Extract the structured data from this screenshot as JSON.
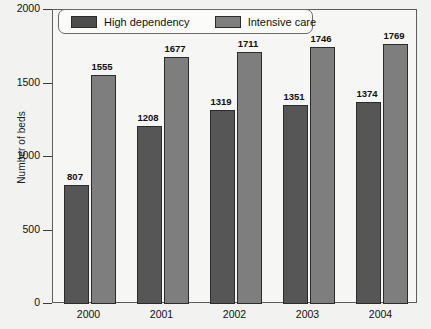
{
  "chart_data": {
    "type": "bar",
    "title": "",
    "xlabel": "",
    "ylabel": "Number of beds",
    "categories": [
      "2000",
      "2001",
      "2002",
      "2003",
      "2004"
    ],
    "series": [
      {
        "name": "High dependency",
        "color": "#565656",
        "values": [
          807,
          1208,
          1319,
          1351,
          1374
        ]
      },
      {
        "name": "Intensive care",
        "color": "#7e7e7e",
        "values": [
          1555,
          1677,
          1711,
          1746,
          1769
        ]
      }
    ],
    "ylim": [
      0,
      2000
    ],
    "yticks": [
      "0",
      "500",
      "1000",
      "1500",
      "2000"
    ],
    "grid": false,
    "legend_position": "top-left",
    "data_labels": true
  },
  "legend": {
    "items": [
      {
        "label": "High dependency",
        "swatch": "dark-gray-swatch"
      },
      {
        "label": "Intensive care",
        "swatch": "medium-gray-swatch"
      }
    ]
  },
  "axes": {
    "y_title": "Number of beds",
    "y_ticks": [
      "2000",
      "1500",
      "1000",
      "500",
      "0"
    ],
    "x_ticks": [
      "2000",
      "2001",
      "2002",
      "2003",
      "2004"
    ]
  },
  "labels": {
    "values": [
      "807",
      "1555",
      "1208",
      "1677",
      "1319",
      "1711",
      "1351",
      "1746",
      "1374",
      "1769"
    ]
  }
}
